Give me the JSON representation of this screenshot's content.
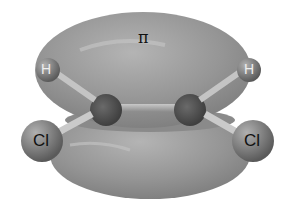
{
  "diagram": {
    "orbital_label": "π",
    "atoms": {
      "hydrogen_left": "H",
      "hydrogen_right": "H",
      "chlorine_left": "Cl",
      "chlorine_right": "Cl"
    },
    "colors": {
      "lobe": "#8f8f8f",
      "atom": "#6e6e6e",
      "background": "#ffffff"
    }
  }
}
